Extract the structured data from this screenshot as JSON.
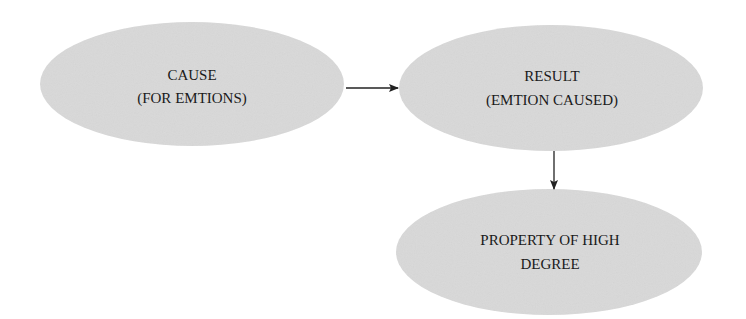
{
  "diagram": {
    "type": "flowchart",
    "colors": {
      "node_fill": "#d9d9d9",
      "edge": "#222222",
      "text": "#1a1a1a"
    },
    "nodes": [
      {
        "id": "cause",
        "lines": [
          "CAUSE",
          "(FOR EMTIONS)"
        ]
      },
      {
        "id": "result",
        "lines": [
          "RESULT",
          "(EMTION CAUSED)"
        ]
      },
      {
        "id": "property",
        "lines": [
          "PROPERTY OF HIGH",
          "DEGREE"
        ]
      }
    ],
    "edges": [
      {
        "from": "cause",
        "to": "result"
      },
      {
        "from": "result",
        "to": "property"
      }
    ]
  }
}
